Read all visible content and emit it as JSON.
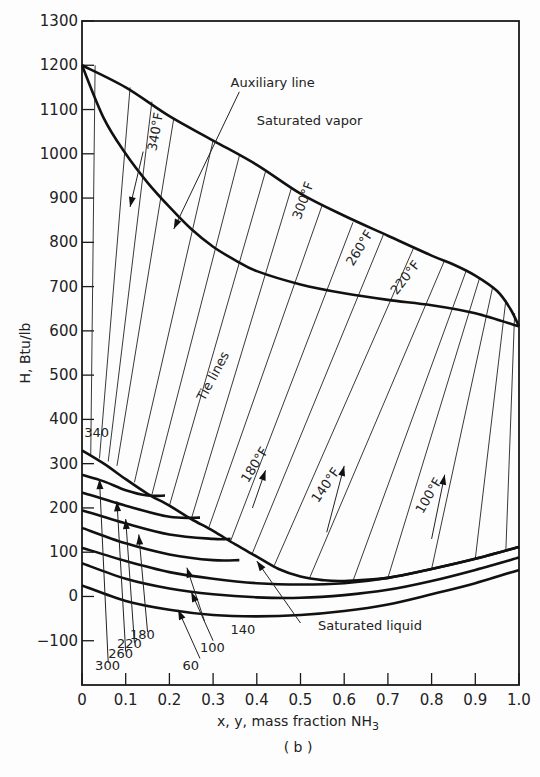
{
  "chart_data": {
    "type": "line",
    "title": "",
    "caption": "( b )",
    "xlabel": "x, y, mass fraction NH",
    "xlabel_sub": "3",
    "ylabel": "H, Btu/lb",
    "xlim": [
      0,
      1.0
    ],
    "ylim": [
      -200,
      1300
    ],
    "grid": false,
    "x_ticks": [
      0,
      0.1,
      0.2,
      0.3,
      0.4,
      0.5,
      0.6,
      0.7,
      0.8,
      0.9,
      1.0
    ],
    "x_tick_labels": [
      "0",
      "0.1",
      "0.2",
      "0.3",
      "0.4",
      "0.5",
      "0.6",
      "0.7",
      "0.8",
      "0.9",
      "1.0"
    ],
    "y_ticks": [
      -100,
      0,
      100,
      200,
      300,
      400,
      500,
      600,
      700,
      800,
      900,
      1000,
      1100,
      1200,
      1300
    ],
    "y_tick_labels": [
      "−100",
      "0",
      "100",
      "200",
      "300",
      "400",
      "500",
      "600",
      "700",
      "800",
      "900",
      "1000",
      "1100",
      "1200",
      "1300"
    ],
    "series": [
      {
        "name": "Saturated vapor",
        "x": [
          0,
          0.1,
          0.2,
          0.3,
          0.4,
          0.5,
          0.6,
          0.7,
          0.8,
          0.85,
          0.9,
          0.95,
          0.98,
          1.0
        ],
        "y": [
          1200,
          1150,
          1085,
          1030,
          975,
          910,
          860,
          815,
          770,
          750,
          725,
          690,
          650,
          610
        ]
      },
      {
        "name": "Auxiliary line",
        "x": [
          0,
          0.05,
          0.1,
          0.15,
          0.2,
          0.25,
          0.3,
          0.35,
          0.4,
          0.5,
          0.6,
          0.7,
          0.8,
          0.9,
          1.0
        ],
        "y": [
          1200,
          1080,
          1000,
          935,
          880,
          830,
          790,
          760,
          735,
          705,
          685,
          670,
          658,
          640,
          610
        ]
      },
      {
        "name": "Saturated liquid",
        "x": [
          0,
          0.05,
          0.1,
          0.15,
          0.2,
          0.25,
          0.3,
          0.35,
          0.4,
          0.45,
          0.5,
          0.55,
          0.6,
          0.7,
          0.8,
          0.9,
          1.0
        ],
        "y": [
          330,
          300,
          265,
          232,
          205,
          175,
          148,
          118,
          90,
          62,
          45,
          37,
          35,
          42,
          62,
          85,
          112
        ]
      },
      {
        "name": "Isotherm 300",
        "x": [
          0,
          0.05,
          0.1,
          0.15,
          0.19
        ],
        "y": [
          275,
          260,
          240,
          228,
          228
        ]
      },
      {
        "name": "Isotherm 260",
        "x": [
          0,
          0.1,
          0.2,
          0.27
        ],
        "y": [
          235,
          205,
          180,
          178
        ]
      },
      {
        "name": "Isotherm 220",
        "x": [
          0,
          0.1,
          0.2,
          0.3,
          0.34
        ],
        "y": [
          195,
          165,
          140,
          130,
          130
        ]
      },
      {
        "name": "Isotherm 180",
        "x": [
          0,
          0.1,
          0.2,
          0.3,
          0.36
        ],
        "y": [
          155,
          120,
          95,
          82,
          82
        ]
      },
      {
        "name": "Isotherm 140",
        "x": [
          0,
          0.1,
          0.2,
          0.3,
          0.4,
          0.5,
          0.6,
          0.7,
          0.8,
          0.9,
          1.0
        ],
        "y": [
          110,
          80,
          55,
          40,
          30,
          27,
          30,
          42,
          62,
          85,
          112
        ]
      },
      {
        "name": "Isotherm 100",
        "x": [
          0,
          0.1,
          0.2,
          0.3,
          0.4,
          0.5,
          0.6,
          0.7,
          0.8,
          0.9,
          1.0
        ],
        "y": [
          75,
          40,
          18,
          5,
          -2,
          -3,
          3,
          15,
          35,
          60,
          88
        ]
      },
      {
        "name": "Isotherm 60",
        "x": [
          0,
          0.1,
          0.2,
          0.3,
          0.4,
          0.5,
          0.6,
          0.7,
          0.8,
          0.9,
          1.0
        ],
        "y": [
          25,
          -10,
          -30,
          -42,
          -45,
          -42,
          -33,
          -18,
          5,
          30,
          60
        ]
      }
    ],
    "tie_lines": [
      [
        0.02,
        320,
        0.03,
        1200
      ],
      [
        0.04,
        312,
        0.11,
        1150
      ],
      [
        0.06,
        305,
        0.16,
        1118
      ],
      [
        0.08,
        295,
        0.21,
        1080
      ],
      [
        0.12,
        258,
        0.3,
        1030
      ],
      [
        0.16,
        230,
        0.36,
        995
      ],
      [
        0.2,
        205,
        0.42,
        960
      ],
      [
        0.25,
        175,
        0.48,
        925
      ],
      [
        0.29,
        155,
        0.55,
        885
      ],
      [
        0.34,
        125,
        0.62,
        845
      ],
      [
        0.39,
        98,
        0.69,
        818
      ],
      [
        0.44,
        70,
        0.76,
        790
      ],
      [
        0.52,
        40,
        0.83,
        760
      ],
      [
        0.62,
        35,
        0.88,
        738
      ],
      [
        0.7,
        42,
        0.91,
        720
      ],
      [
        0.8,
        62,
        0.94,
        700
      ],
      [
        0.9,
        85,
        0.97,
        670
      ],
      [
        0.97,
        105,
        0.99,
        640
      ]
    ],
    "annotations": [
      {
        "id": "aux",
        "text": "Auxiliary line",
        "x": 0.34,
        "y": 1150,
        "rotate": 0
      },
      {
        "id": "vap",
        "text": "Saturated vapor",
        "x": 0.4,
        "y": 1065,
        "rotate": 0
      },
      {
        "id": "t340f",
        "text": "340°F",
        "x": 0.17,
        "y": 1005,
        "rotate": -80
      },
      {
        "id": "t300f",
        "text": "300°F",
        "x": 0.5,
        "y": 850,
        "rotate": -70
      },
      {
        "id": "t260f",
        "text": "260°F",
        "x": 0.62,
        "y": 745,
        "rotate": -58
      },
      {
        "id": "t220f",
        "text": "220°F",
        "x": 0.72,
        "y": 680,
        "rotate": -52
      },
      {
        "id": "tie",
        "text": "Tie lines",
        "x": 0.28,
        "y": 440,
        "rotate": -62
      },
      {
        "id": "t180f",
        "text": "180°F",
        "x": 0.38,
        "y": 255,
        "rotate": -58
      },
      {
        "id": "t140f",
        "text": "140°F",
        "x": 0.54,
        "y": 210,
        "rotate": -55
      },
      {
        "id": "t100f",
        "text": "100°F",
        "x": 0.78,
        "y": 185,
        "rotate": -60
      },
      {
        "id": "liq",
        "text": "Saturated liquid",
        "x": 0.54,
        "y": -75,
        "rotate": 0
      },
      {
        "id": "l340",
        "text": "340",
        "x": 0.005,
        "y": 360,
        "rotate": 0
      },
      {
        "id": "l300",
        "text": "300",
        "x": 0.03,
        "y": -165,
        "rotate": 0
      },
      {
        "id": "l260",
        "text": "260",
        "x": 0.06,
        "y": -140,
        "rotate": 0
      },
      {
        "id": "l220",
        "text": "220",
        "x": 0.08,
        "y": -117,
        "rotate": 0
      },
      {
        "id": "l180",
        "text": "180",
        "x": 0.11,
        "y": -95,
        "rotate": 0
      },
      {
        "id": "l60",
        "text": "60",
        "x": 0.23,
        "y": -165,
        "rotate": 0
      },
      {
        "id": "l100",
        "text": "100",
        "x": 0.27,
        "y": -125,
        "rotate": 0
      },
      {
        "id": "l140",
        "text": "140",
        "x": 0.34,
        "y": -85,
        "rotate": 0
      }
    ],
    "arrows": [
      {
        "from": [
          0.36,
          1140
        ],
        "to": [
          0.21,
          830
        ]
      },
      {
        "from": [
          0.14,
          1005
        ],
        "to": [
          0.11,
          880
        ]
      },
      {
        "from": [
          0.39,
          200
        ],
        "to": [
          0.42,
          285
        ]
      },
      {
        "from": [
          0.56,
          145
        ],
        "to": [
          0.6,
          295
        ]
      },
      {
        "from": [
          0.8,
          130
        ],
        "to": [
          0.83,
          275
        ]
      },
      {
        "from": [
          0.5,
          -60
        ],
        "to": [
          0.4,
          80
        ]
      },
      {
        "from": [
          0.06,
          -150
        ],
        "to": [
          0.04,
          265
        ]
      },
      {
        "from": [
          0.1,
          -125
        ],
        "to": [
          0.08,
          215
        ]
      },
      {
        "from": [
          0.12,
          -105
        ],
        "to": [
          0.1,
          175
        ]
      },
      {
        "from": [
          0.15,
          -80
        ],
        "to": [
          0.13,
          140
        ]
      },
      {
        "from": [
          0.28,
          -55
        ],
        "to": [
          0.24,
          65
        ]
      },
      {
        "from": [
          0.3,
          -100
        ],
        "to": [
          0.25,
          10
        ]
      },
      {
        "from": [
          0.27,
          -140
        ],
        "to": [
          0.22,
          -30
        ]
      }
    ]
  }
}
